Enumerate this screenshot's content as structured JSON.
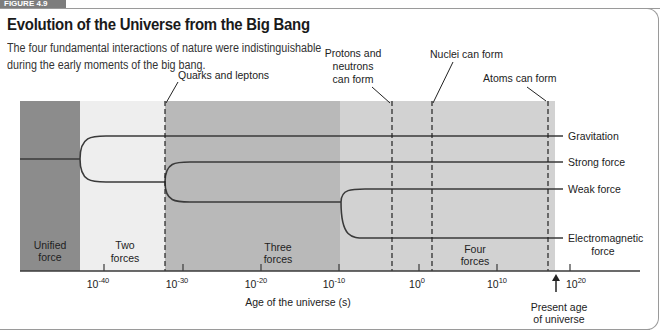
{
  "figure": {
    "tab_label": "FIGURE 4.9",
    "title": "Evolution of the Universe from the Big Bang",
    "subtitle_line1": "The four fundamental interactions of nature were indistinguishable",
    "subtitle_line2": "during the early moments of the big bang."
  },
  "diagram": {
    "eras": [
      {
        "label_line1": "Unified",
        "label_line2": "force",
        "color": "#8c8c8c"
      },
      {
        "label_line1": "Two",
        "label_line2": "forces",
        "color": "#eeeeee"
      },
      {
        "label_line1": "Three",
        "label_line2": "forces",
        "color": "#b9b9b9"
      },
      {
        "label_line1": "Four",
        "label_line2": "forces",
        "color": "#d2d2d2"
      }
    ],
    "forces": [
      {
        "label": "Gravitation"
      },
      {
        "label": "Strong force"
      },
      {
        "label": "Weak force"
      },
      {
        "label": "Electromagnetic",
        "label_line2": "force"
      }
    ],
    "events": [
      {
        "label": "Quarks and leptons"
      },
      {
        "label_line1": "Protons and",
        "label_line2": "neutrons",
        "label_line3": "can form"
      },
      {
        "label": "Nuclei can form"
      },
      {
        "label": "Atoms can form"
      }
    ],
    "axis": {
      "title": "Age of the universe (s)",
      "ticks": [
        {
          "base": "10",
          "exp": "-40"
        },
        {
          "base": "10",
          "exp": "-30"
        },
        {
          "base": "10",
          "exp": "-20"
        },
        {
          "base": "10",
          "exp": "-10"
        },
        {
          "base": "10",
          "exp": "0"
        },
        {
          "base": "10",
          "exp": "10"
        },
        {
          "base": "10",
          "exp": "20"
        }
      ],
      "marker_line1": "Present age",
      "marker_line2": "of universe"
    },
    "colors": {
      "line": "#3a3a3a",
      "text": "#222222"
    }
  }
}
